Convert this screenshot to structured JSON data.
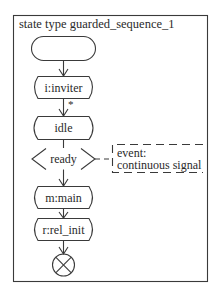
{
  "diagram": {
    "title": "state type guarded_sequence_1",
    "nodes": [
      {
        "id": "start",
        "type": "start",
        "label": ""
      },
      {
        "id": "inviter",
        "type": "task",
        "label": "i:inviter"
      },
      {
        "id": "idle",
        "type": "state",
        "label": "idle"
      },
      {
        "id": "ready",
        "type": "guard",
        "label": "ready"
      },
      {
        "id": "main",
        "type": "task",
        "label": "m:main"
      },
      {
        "id": "rel_init",
        "type": "task",
        "label": "r:rel_init"
      },
      {
        "id": "end",
        "type": "terminator",
        "label": ""
      }
    ],
    "edges": [
      {
        "from": "start",
        "to": "inviter",
        "label": ""
      },
      {
        "from": "inviter",
        "to": "idle",
        "label": "*"
      },
      {
        "from": "idle",
        "to": "ready",
        "label": ""
      },
      {
        "from": "ready",
        "to": "main",
        "label": ""
      },
      {
        "from": "main",
        "to": "rel_init",
        "label": ""
      },
      {
        "from": "rel_init",
        "to": "end",
        "label": ""
      }
    ],
    "comment": {
      "attached_to": "ready",
      "line1": "event:",
      "line2": "continuous signal"
    }
  }
}
